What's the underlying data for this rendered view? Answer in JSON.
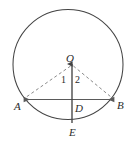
{
  "figure": {
    "colors": {
      "background": "#ffffff",
      "stroke": "#444444",
      "dashed_stroke": "#8a8a8a",
      "chord_stroke": "#5a5a5a",
      "text": "#2b2b2b"
    },
    "geometry": {
      "circle": {
        "cx": 68,
        "cy": 64.5,
        "r": 55
      },
      "center_point": {
        "x": 68,
        "y": 64.5
      },
      "chord": {
        "x1": 22,
        "y1": 99.5,
        "x2": 115,
        "y2": 99.5
      },
      "vertical": {
        "x1": 72,
        "y1": 63,
        "x2": 72,
        "y2": 123
      },
      "radius_OA": {
        "x1": 71,
        "y1": 65,
        "x2": 22,
        "y2": 99
      },
      "radius_OB": {
        "x1": 73,
        "y1": 65,
        "x2": 114,
        "y2": 99
      }
    },
    "labels": {
      "center": "O",
      "left_endpoint": "A",
      "right_endpoint": "B",
      "foot": "D",
      "bottom": "E",
      "angle_one": "1",
      "angle_two": "2"
    }
  }
}
